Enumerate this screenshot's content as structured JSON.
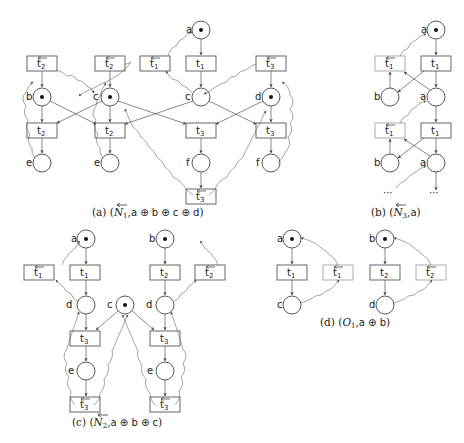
{
  "figures": {
    "a": {
      "caption": "(a) (N⃖₁, a ⊕ b ⊕ c ⊕ d)",
      "caption_prefix": "(a)",
      "caption_net": "N",
      "caption_net_sub": "1",
      "caption_marking": "a ⊕ b ⊕ c ⊕ d",
      "places": [
        {
          "id": "a",
          "label": "a",
          "token": true
        },
        {
          "id": "b",
          "label": "b",
          "token": true
        },
        {
          "id": "c1",
          "label": "c",
          "token": true
        },
        {
          "id": "c2",
          "label": "c",
          "token": false
        },
        {
          "id": "d",
          "label": "d",
          "token": true
        },
        {
          "id": "e1",
          "label": "e",
          "token": false
        },
        {
          "id": "e2",
          "label": "e",
          "token": false
        },
        {
          "id": "f1",
          "label": "f",
          "token": false
        },
        {
          "id": "f2",
          "label": "f",
          "token": false
        }
      ],
      "transitions": [
        {
          "label": "t",
          "sub": "2",
          "reverse": true
        },
        {
          "label": "t",
          "sub": "2",
          "reverse": true
        },
        {
          "label": "t",
          "sub": "1",
          "reverse": true
        },
        {
          "label": "t",
          "sub": "1",
          "reverse": false
        },
        {
          "label": "t",
          "sub": "3",
          "reverse": true
        },
        {
          "label": "t",
          "sub": "2",
          "reverse": false
        },
        {
          "label": "t",
          "sub": "2",
          "reverse": false
        },
        {
          "label": "t",
          "sub": "3",
          "reverse": false
        },
        {
          "label": "t",
          "sub": "3",
          "reverse": false
        },
        {
          "label": "t",
          "sub": "3",
          "reverse": true
        }
      ]
    },
    "b": {
      "caption_prefix": "(b)",
      "caption_net": "N",
      "caption_net_sub": "3",
      "caption_marking": "a",
      "places": [
        {
          "label": "a",
          "token": true
        },
        {
          "label": "b",
          "token": false
        },
        {
          "label": "a",
          "token": false
        },
        {
          "label": "b",
          "token": false
        },
        {
          "label": "a",
          "token": false
        }
      ],
      "transitions": [
        {
          "label": "t",
          "sub": "1",
          "reverse": true
        },
        {
          "label": "t",
          "sub": "1",
          "reverse": false
        },
        {
          "label": "t",
          "sub": "1",
          "reverse": true
        },
        {
          "label": "t",
          "sub": "1",
          "reverse": false
        }
      ],
      "ellipsis": "···"
    },
    "c": {
      "caption_prefix": "(c)",
      "caption_net": "N",
      "caption_net_sub": "2",
      "caption_marking": "a ⊕ b ⊕ c",
      "places": [
        {
          "label": "a",
          "token": true
        },
        {
          "label": "b",
          "token": true
        },
        {
          "label": "c",
          "token": true
        },
        {
          "label": "d",
          "token": false
        },
        {
          "label": "d",
          "token": false
        },
        {
          "label": "e",
          "token": false
        },
        {
          "label": "e",
          "token": false
        }
      ],
      "transitions": [
        {
          "label": "t",
          "sub": "1",
          "reverse": true
        },
        {
          "label": "t",
          "sub": "1",
          "reverse": false
        },
        {
          "label": "t",
          "sub": "2",
          "reverse": false
        },
        {
          "label": "t",
          "sub": "2",
          "reverse": true
        },
        {
          "label": "t",
          "sub": "3",
          "reverse": false
        },
        {
          "label": "t",
          "sub": "3",
          "reverse": false
        },
        {
          "label": "t",
          "sub": "3",
          "reverse": true
        },
        {
          "label": "t",
          "sub": "3",
          "reverse": true
        }
      ]
    },
    "d": {
      "caption_prefix": "(d)",
      "caption_net": "O",
      "caption_net_sub": "1",
      "caption_marking": "a ⊕ b",
      "places": [
        {
          "label": "a",
          "token": true
        },
        {
          "label": "b",
          "token": true
        },
        {
          "label": "c",
          "token": false
        },
        {
          "label": "d",
          "token": false
        }
      ],
      "transitions": [
        {
          "label": "t",
          "sub": "1",
          "reverse": false
        },
        {
          "label": "t",
          "sub": "1",
          "reverse": true
        },
        {
          "label": "t",
          "sub": "2",
          "reverse": false
        },
        {
          "label": "t",
          "sub": "2",
          "reverse": true
        }
      ]
    }
  },
  "labels": {
    "a": "a",
    "b": "b",
    "c": "c",
    "d": "d",
    "e": "e",
    "f": "f",
    "t": "t",
    "s1": "1",
    "s2": "2",
    "s3": "3",
    "open": "(",
    "close": ")",
    "comma": ",",
    "N": "N",
    "O": "O",
    "pa": "(a)",
    "pb": "(b)",
    "pc": "(c)",
    "pd": "(d)",
    "m_a": "a ⊕ b ⊕ c ⊕ d",
    "m_b": "a",
    "m_c": "a ⊕ b ⊕ c",
    "m_d": "a ⊕ b",
    "dots": "···"
  }
}
